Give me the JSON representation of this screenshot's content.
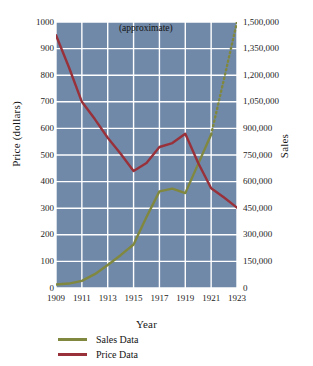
{
  "chart_data": {
    "type": "line",
    "title": "",
    "xlabel": "Year",
    "ylabel": "Price (dollars)",
    "y2label": "Sales",
    "grid": true,
    "legend_position": "bottom-left",
    "annotations": [
      {
        "text": "(approximate)",
        "x": 1918.2,
        "y_axis": "left",
        "y": 975
      }
    ],
    "x": [
      1909,
      1910,
      1911,
      1912,
      1913,
      1914,
      1915,
      1916,
      1917,
      1918,
      1919,
      1920,
      1921,
      1922,
      1923
    ],
    "xlim": [
      1909,
      1923
    ],
    "xticks": [
      1909,
      1911,
      1913,
      1915,
      1917,
      1919,
      1921,
      1923
    ],
    "xtick_labels": [
      "1909",
      "1911",
      "1913",
      "1915",
      "1917",
      "1919",
      "1921",
      "1923"
    ],
    "ylim": [
      0,
      1000
    ],
    "yticks": [
      0,
      100,
      200,
      300,
      400,
      500,
      600,
      700,
      800,
      900,
      1000
    ],
    "ytick_labels": [
      "0",
      "100",
      "200",
      "300",
      "400",
      "500",
      "600",
      "700",
      "800",
      "900",
      "1000"
    ],
    "y2lim": [
      0,
      1500000
    ],
    "y2ticks": [
      0,
      150000,
      300000,
      450000,
      600000,
      750000,
      900000,
      1050000,
      1200000,
      1350000,
      1500000
    ],
    "y2tick_labels": [
      "0",
      "150,000",
      "300,000",
      "450,000",
      "600,000",
      "750,000",
      "900,000",
      "1,050,000",
      "1,200,000",
      "1,350,000",
      "1,500,000"
    ],
    "series": [
      {
        "name": "Sales Data",
        "axis": "right",
        "color": "#80883f",
        "style": "solid-then-dotted",
        "dotted_from": 1921,
        "values": [
          20000,
          25000,
          40000,
          78000,
          130000,
          185000,
          245000,
          400000,
          545000,
          560000,
          535000,
          700000,
          865000,
          1180000,
          1500000
        ]
      },
      {
        "name": "Price Data",
        "axis": "left",
        "color": "#99313a",
        "style": "solid",
        "values": [
          950,
          830,
          700,
          635,
          565,
          505,
          440,
          470,
          530,
          545,
          580,
          470,
          375,
          340,
          302
        ]
      }
    ],
    "colors": {
      "plot_background": "#7089a8",
      "gridline": "#ffffff",
      "page_background": "#ffffff",
      "sales": "#80883f",
      "price": "#99313a"
    }
  },
  "legend": {
    "items": [
      {
        "label": "Sales Data",
        "color": "#80883f"
      },
      {
        "label": "Price Data",
        "color": "#99313a"
      }
    ]
  }
}
